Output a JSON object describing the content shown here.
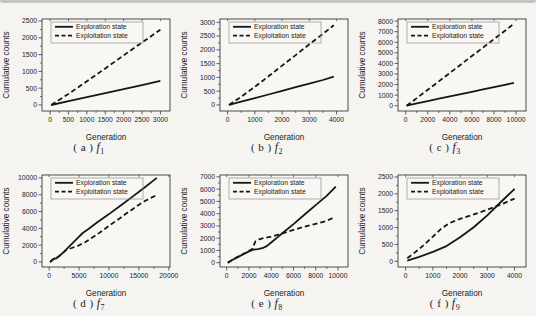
{
  "figure": {
    "background": "#f5f4f1",
    "top_strip_color": "#b9b8b5",
    "plot_bg": "#f8f7f4",
    "line_color": "#161616",
    "frame_color": "#3a3a38",
    "text_color": "#222222",
    "legend_border_color": "#8f8e8c",
    "xlabel": "Generation",
    "ylabel": "Cumulative counts",
    "legend_labels": [
      "Exploration state",
      "Exploitation state"
    ]
  },
  "chart_data": [
    {
      "id": "a",
      "type": "line",
      "caption": {
        "prefix": "( a )",
        "symbol": "f",
        "sub": "1"
      },
      "xlabel": "Generation",
      "ylabel": "Cumulative counts",
      "legend_position": "top-left",
      "grid": false,
      "xlim": [
        -220,
        3260
      ],
      "ylim": [
        -180,
        2560
      ],
      "xticks": [
        0,
        500,
        1000,
        1500,
        2000,
        2500,
        3000
      ],
      "yticks": [
        0,
        500,
        1000,
        1500,
        2000,
        2500
      ],
      "series": [
        {
          "name": "Exploration state",
          "style": "solid",
          "points": [
            [
              30,
              0
            ],
            [
              500,
              115
            ],
            [
              1000,
              235
            ],
            [
              1500,
              350
            ],
            [
              2000,
              470
            ],
            [
              2500,
              590
            ],
            [
              3000,
              720
            ]
          ]
        },
        {
          "name": "Exploitation state",
          "style": "dashed",
          "points": [
            [
              30,
              0
            ],
            [
              500,
              330
            ],
            [
              1000,
              705
            ],
            [
              1500,
              1090
            ],
            [
              2000,
              1480
            ],
            [
              2500,
              1860
            ],
            [
              3000,
              2240
            ]
          ]
        }
      ]
    },
    {
      "id": "b",
      "type": "line",
      "caption": {
        "prefix": "( b )",
        "symbol": "f",
        "sub": "2"
      },
      "xlabel": "Generation",
      "ylabel": "Cumulative counts",
      "legend_position": "top-left",
      "grid": false,
      "xlim": [
        -280,
        4420
      ],
      "ylim": [
        -220,
        3120
      ],
      "xticks": [
        0,
        1000,
        2000,
        3000,
        4000
      ],
      "yticks": [
        0,
        500,
        1000,
        1500,
        2000,
        2500,
        3000
      ],
      "series": [
        {
          "name": "Exploration state",
          "style": "solid",
          "points": [
            [
              50,
              0
            ],
            [
              500,
              120
            ],
            [
              1000,
              250
            ],
            [
              1500,
              380
            ],
            [
              2000,
              515
            ],
            [
              2500,
              645
            ],
            [
              3000,
              775
            ],
            [
              3500,
              905
            ],
            [
              3900,
              1030
            ]
          ]
        },
        {
          "name": "Exploitation state",
          "style": "dashed",
          "points": [
            [
              50,
              0
            ],
            [
              500,
              300
            ],
            [
              1000,
              660
            ],
            [
              1500,
              1040
            ],
            [
              2000,
              1430
            ],
            [
              2500,
              1810
            ],
            [
              3000,
              2200
            ],
            [
              3500,
              2580
            ],
            [
              3900,
              2890
            ]
          ]
        }
      ]
    },
    {
      "id": "c",
      "type": "line",
      "caption": {
        "prefix": "( c )",
        "symbol": "f",
        "sub": "3"
      },
      "xlabel": "Generation",
      "ylabel": "Cumulative counts",
      "legend_position": "top-left",
      "grid": false,
      "xlim": [
        -700,
        10900
      ],
      "ylim": [
        -500,
        8200
      ],
      "xticks": [
        0,
        2000,
        4000,
        6000,
        8000,
        10000
      ],
      "yticks": [
        0,
        1000,
        2000,
        3000,
        4000,
        5000,
        6000,
        7000,
        8000
      ],
      "series": [
        {
          "name": "Exploration state",
          "style": "solid",
          "points": [
            [
              80,
              0
            ],
            [
              1000,
              220
            ],
            [
              2000,
              440
            ],
            [
              3000,
              660
            ],
            [
              4000,
              880
            ],
            [
              5000,
              1100
            ],
            [
              6000,
              1320
            ],
            [
              7000,
              1540
            ],
            [
              8000,
              1760
            ],
            [
              9000,
              1980
            ],
            [
              9800,
              2160
            ]
          ]
        },
        {
          "name": "Exploitation state",
          "style": "dashed",
          "points": [
            [
              80,
              0
            ],
            [
              1000,
              720
            ],
            [
              2000,
              1510
            ],
            [
              3000,
              2300
            ],
            [
              4000,
              3100
            ],
            [
              5000,
              3900
            ],
            [
              6000,
              4700
            ],
            [
              7000,
              5500
            ],
            [
              8000,
              6300
            ],
            [
              9000,
              7080
            ],
            [
              9800,
              7760
            ]
          ]
        }
      ]
    },
    {
      "id": "d",
      "type": "line",
      "caption": {
        "prefix": "( d )",
        "symbol": "f",
        "sub": "7"
      },
      "xlabel": "Generation",
      "ylabel": "Cumulative counts",
      "legend_position": "top-left",
      "grid": false,
      "xlim": [
        -1200,
        20200
      ],
      "ylim": [
        -600,
        10350
      ],
      "xticks": [
        0,
        5000,
        10000,
        15000,
        20000
      ],
      "yticks": [
        0,
        2000,
        4000,
        6000,
        8000,
        10000
      ],
      "series": [
        {
          "name": "Exploration state",
          "style": "solid",
          "points": [
            [
              150,
              0
            ],
            [
              600,
              280
            ],
            [
              900,
              430
            ],
            [
              1150,
              400
            ],
            [
              1600,
              640
            ],
            [
              2000,
              900
            ],
            [
              2500,
              1230
            ],
            [
              3000,
              1580
            ],
            [
              3500,
              1930
            ],
            [
              4000,
              2290
            ],
            [
              4500,
              2650
            ],
            [
              5000,
              3020
            ],
            [
              5600,
              3450
            ],
            [
              6500,
              3900
            ],
            [
              8000,
              4700
            ],
            [
              10000,
              5700
            ],
            [
              12000,
              6750
            ],
            [
              14000,
              7800
            ],
            [
              16000,
              8900
            ],
            [
              18000,
              10000
            ]
          ]
        },
        {
          "name": "Exploitation state",
          "style": "dashed",
          "points": [
            [
              150,
              0
            ],
            [
              600,
              280
            ],
            [
              1000,
              450
            ],
            [
              1500,
              620
            ],
            [
              2000,
              880
            ],
            [
              2400,
              1130
            ],
            [
              2800,
              1420
            ],
            [
              3300,
              1530
            ],
            [
              4000,
              1720
            ],
            [
              5000,
              1980
            ],
            [
              6000,
              2350
            ],
            [
              7000,
              2800
            ],
            [
              8000,
              3270
            ],
            [
              9000,
              3780
            ],
            [
              10000,
              4300
            ],
            [
              11000,
              4800
            ],
            [
              12000,
              5300
            ],
            [
              13000,
              5820
            ],
            [
              14000,
              6300
            ],
            [
              15000,
              6800
            ],
            [
              16000,
              7250
            ],
            [
              17000,
              7620
            ],
            [
              17800,
              7900
            ]
          ]
        }
      ]
    },
    {
      "id": "e",
      "type": "line",
      "caption": {
        "prefix": "( e )",
        "symbol": "f",
        "sub": "8"
      },
      "xlabel": "Generation",
      "ylabel": "Cumulative counts",
      "legend_position": "top-left",
      "grid": false,
      "xlim": [
        -600,
        10900
      ],
      "ylim": [
        -350,
        7150
      ],
      "xticks": [
        0,
        2000,
        4000,
        6000,
        8000,
        10000
      ],
      "yticks": [
        0,
        1000,
        2000,
        3000,
        4000,
        5000,
        6000,
        7000
      ],
      "series": [
        {
          "name": "Exploration state",
          "style": "solid",
          "points": [
            [
              100,
              0
            ],
            [
              500,
              220
            ],
            [
              1000,
              460
            ],
            [
              1500,
              690
            ],
            [
              2000,
              920
            ],
            [
              2400,
              1060
            ],
            [
              2800,
              1110
            ],
            [
              3200,
              1180
            ],
            [
              3600,
              1350
            ],
            [
              4000,
              1650
            ],
            [
              4500,
              2020
            ],
            [
              5000,
              2400
            ],
            [
              6000,
              3150
            ],
            [
              7000,
              3930
            ],
            [
              8000,
              4700
            ],
            [
              9000,
              5470
            ],
            [
              9800,
              6200
            ]
          ]
        },
        {
          "name": "Exploitation state",
          "style": "dashed",
          "points": [
            [
              100,
              0
            ],
            [
              500,
              240
            ],
            [
              1000,
              490
            ],
            [
              1500,
              720
            ],
            [
              2000,
              960
            ],
            [
              2300,
              1120
            ],
            [
              2450,
              1450
            ],
            [
              2600,
              1750
            ],
            [
              2900,
              1900
            ],
            [
              3300,
              2000
            ],
            [
              4000,
              2130
            ],
            [
              5000,
              2380
            ],
            [
              6000,
              2680
            ],
            [
              7000,
              2940
            ],
            [
              8000,
              3170
            ],
            [
              9000,
              3420
            ],
            [
              9600,
              3680
            ]
          ]
        }
      ]
    },
    {
      "id": "f",
      "type": "line",
      "caption": {
        "prefix": "( f )",
        "symbol": "f",
        "sub": "9"
      },
      "xlabel": "Generation",
      "ylabel": "Cumulative counts",
      "legend_position": "top-left",
      "grid": false,
      "xlim": [
        -280,
        4420
      ],
      "ylim": [
        -170,
        2560
      ],
      "xticks": [
        0,
        1000,
        2000,
        3000,
        4000
      ],
      "yticks": [
        0,
        500,
        1000,
        1500,
        2000,
        2500
      ],
      "series": [
        {
          "name": "Exploration state",
          "style": "solid",
          "points": [
            [
              60,
              20
            ],
            [
              500,
              130
            ],
            [
              1000,
              280
            ],
            [
              1500,
              450
            ],
            [
              2000,
              710
            ],
            [
              2500,
              1010
            ],
            [
              3000,
              1360
            ],
            [
              3500,
              1760
            ],
            [
              4000,
              2150
            ]
          ]
        },
        {
          "name": "Exploitation state",
          "style": "dashed",
          "points": [
            [
              60,
              90
            ],
            [
              500,
              360
            ],
            [
              1000,
              730
            ],
            [
              1300,
              960
            ],
            [
              1600,
              1130
            ],
            [
              2000,
              1260
            ],
            [
              2400,
              1360
            ],
            [
              2800,
              1470
            ],
            [
              3200,
              1590
            ],
            [
              3600,
              1720
            ],
            [
              4000,
              1860
            ]
          ]
        }
      ]
    }
  ]
}
